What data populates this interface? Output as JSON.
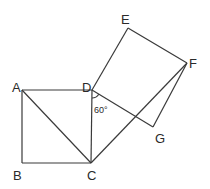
{
  "diagram": {
    "title": "",
    "points": {
      "A": {
        "label": "A",
        "x": 22,
        "y": 90,
        "lx": 12,
        "ly": 92
      },
      "B": {
        "label": "B",
        "x": 22,
        "y": 163,
        "lx": 13,
        "ly": 180
      },
      "C": {
        "label": "C",
        "x": 91,
        "y": 163,
        "lx": 87,
        "ly": 180
      },
      "D": {
        "label": "D",
        "x": 92,
        "y": 90,
        "lx": 82,
        "ly": 92
      },
      "E": {
        "label": "E",
        "x": 128,
        "y": 28,
        "lx": 121,
        "ly": 24
      },
      "F": {
        "label": "F",
        "x": 187,
        "y": 63,
        "lx": 189,
        "ly": 68
      },
      "G": {
        "label": "G",
        "x": 153,
        "y": 127,
        "lx": 155,
        "ly": 143
      }
    },
    "segments": [
      [
        "A",
        "B"
      ],
      [
        "B",
        "C"
      ],
      [
        "C",
        "D"
      ],
      [
        "D",
        "A"
      ],
      [
        "A",
        "C"
      ],
      [
        "D",
        "E"
      ],
      [
        "E",
        "F"
      ],
      [
        "F",
        "G"
      ],
      [
        "G",
        "D"
      ],
      [
        "C",
        "F"
      ]
    ],
    "angle_label": "60°",
    "angle_vertex": "D"
  }
}
